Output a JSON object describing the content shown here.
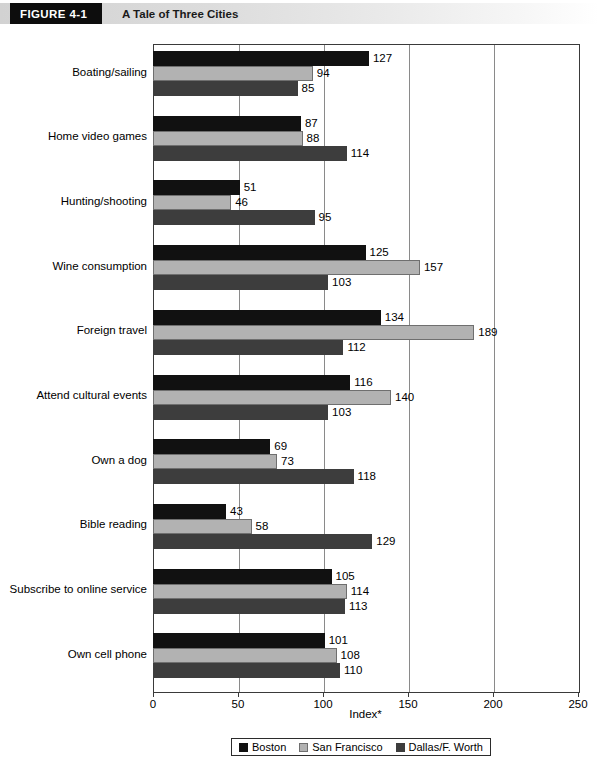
{
  "header": {
    "figure_tag": "FIGURE  4-1",
    "title": "A Tale of Three Cities"
  },
  "legend": {
    "entries": [
      {
        "label": "Boston",
        "color": "#111111"
      },
      {
        "label": "San Francisco",
        "color": "#b2b2b2"
      },
      {
        "label": "Dallas/F. Worth",
        "color": "#3d3d3d"
      }
    ]
  },
  "axis": {
    "x_title": "Index*",
    "ticks": [
      "0",
      "50",
      "100",
      "150",
      "200",
      "250"
    ]
  },
  "chart_data": {
    "type": "bar",
    "orientation": "horizontal",
    "title": "A Tale of Three Cities",
    "xlabel": "Index*",
    "ylabel": "",
    "xlim": [
      0,
      250
    ],
    "xticks": [
      0,
      50,
      100,
      150,
      200,
      250
    ],
    "grid": true,
    "legend_position": "bottom",
    "categories": [
      "Boating/sailing",
      "Home video games",
      "Hunting/shooting",
      "Wine consumption",
      "Foreign travel",
      "Attend cultural events",
      "Own a dog",
      "Bible reading",
      "Subscribe to online service",
      "Own cell phone"
    ],
    "series": [
      {
        "name": "Boston",
        "color": "#111111",
        "values": [
          127,
          87,
          51,
          125,
          134,
          116,
          69,
          43,
          105,
          101
        ]
      },
      {
        "name": "San Francisco",
        "color": "#b2b2b2",
        "values": [
          94,
          88,
          46,
          157,
          189,
          140,
          73,
          58,
          114,
          108
        ]
      },
      {
        "name": "Dallas/F. Worth",
        "color": "#3d3d3d",
        "values": [
          85,
          114,
          95,
          103,
          112,
          103,
          118,
          129,
          113,
          110
        ]
      }
    ]
  }
}
